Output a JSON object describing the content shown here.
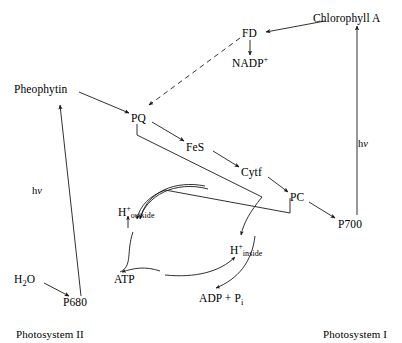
{
  "diagram": {
    "background_color": "#ffffff",
    "stroke_color": "#1a1a1a",
    "nodes": {
      "pheophytin": "Pheophytin",
      "pq": "PQ",
      "fes": "FeS",
      "cytf": "Cytf",
      "pc": "PC",
      "p700": "P700",
      "p680": "P680",
      "water": "H",
      "water_sub": "2",
      "water_tail": "O",
      "fd": "FD",
      "nadp": "NADP",
      "nadp_charge": "+",
      "chlorophyll_a": "Chlorophyll A",
      "h_outside_symbol": "H",
      "h_outside_charge": "+",
      "h_outside_sub": "outside",
      "h_inside_symbol": "H",
      "h_inside_charge": "+",
      "h_inside_sub": "inside",
      "atp": "ATP",
      "adp": "ADP + P",
      "adp_sub": "i"
    },
    "photon_labels": {
      "left": {
        "h": "h",
        "nu": "v"
      },
      "right": {
        "h": "h",
        "nu": "v"
      }
    },
    "system_labels": {
      "photosystem_2": "Photosystem II",
      "photosystem_1": "Photosystem I"
    },
    "edges": [
      {
        "name": "p680-to-pheophytin",
        "style": "solid",
        "label": "hv"
      },
      {
        "name": "pheophytin-to-pq",
        "style": "solid"
      },
      {
        "name": "pq-to-fes",
        "style": "solid"
      },
      {
        "name": "fes-to-cytf",
        "style": "solid"
      },
      {
        "name": "cytf-to-pc",
        "style": "solid"
      },
      {
        "name": "pc-to-p700",
        "style": "solid"
      },
      {
        "name": "p700-to-chlorophyll-a",
        "style": "solid",
        "label": "hv"
      },
      {
        "name": "chlorophyll-a-to-fd",
        "style": "solid"
      },
      {
        "name": "fd-to-nadp",
        "style": "solid"
      },
      {
        "name": "fd-to-pq-cyclic",
        "style": "dashed"
      },
      {
        "name": "water-to-p680",
        "style": "solid"
      },
      {
        "name": "pq-to-h-inside",
        "style": "solid-curved"
      },
      {
        "name": "pc-to-h-inside",
        "style": "solid-curved"
      },
      {
        "name": "h-inside-to-h-outside",
        "style": "curved"
      },
      {
        "name": "h-outside-to-atp",
        "style": "curved"
      },
      {
        "name": "adp-to-h-inside",
        "style": "curved"
      }
    ]
  }
}
